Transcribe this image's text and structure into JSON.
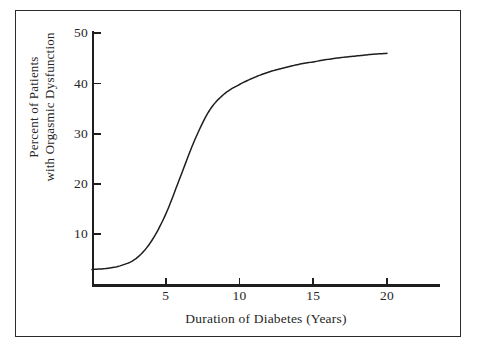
{
  "chart_data": {
    "type": "line",
    "title": "",
    "xlabel": "Duration of Diabetes (Years)",
    "ylabel": "Percent of Patients with Orgasmic Dysfunction",
    "ylabel_line1": "Percent of Patients",
    "ylabel_line2": "with Orgasmic Dysfunction",
    "xlim": [
      0,
      23.5
    ],
    "ylim": [
      0,
      50
    ],
    "xticks": [
      5,
      10,
      15,
      20
    ],
    "xtick_labels": [
      "5",
      "10",
      "15",
      "20"
    ],
    "yticks": [
      10,
      20,
      30,
      40,
      50
    ],
    "ytick_labels": [
      "10",
      "20",
      "30",
      "40",
      "50"
    ],
    "grid": false,
    "legend": null,
    "series": [
      {
        "name": "Orgasmic dysfunction prevalence",
        "color": "#1e1e1e",
        "x": [
          0,
          1,
          2,
          3,
          4,
          5,
          6,
          7,
          8,
          9,
          10,
          11,
          12,
          13,
          14,
          15,
          16,
          17,
          18,
          19,
          20
        ],
        "values": [
          3.0,
          3.2,
          3.8,
          5.2,
          8.5,
          14.0,
          21.5,
          29.0,
          34.8,
          38.0,
          39.8,
          41.2,
          42.3,
          43.1,
          43.8,
          44.3,
          44.8,
          45.2,
          45.5,
          45.8,
          46.0
        ]
      }
    ]
  },
  "axes": {
    "x_title": "Duration of Diabetes (Years)",
    "y_title_line1": "Percent of Patients",
    "y_title_line2": "with Orgasmic Dysfunction"
  },
  "colors": {
    "line": "#1e1e1e",
    "axis": "#1e1e1e",
    "frame": "#2b2b2b",
    "background": "#ffffff",
    "text": "#262626"
  }
}
